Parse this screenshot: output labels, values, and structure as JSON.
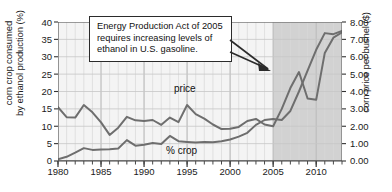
{
  "chart_data": {
    "type": "line",
    "title": "",
    "xlabel": "",
    "ylabel": "corn crop consumed by ethanol production (%)",
    "ylabel_right": "corn price per bushel ($)",
    "xlim": [
      1980,
      2013
    ],
    "ylim": [
      0,
      40
    ],
    "ylim_right": [
      0.0,
      8.0
    ],
    "yticks": [
      0,
      5,
      10,
      15,
      20,
      25,
      30,
      35,
      40
    ],
    "ytick_labels": [
      "0",
      "5",
      "10",
      "15",
      "20",
      "25",
      "30",
      "35",
      "40"
    ],
    "yticks_right": [
      0.0,
      1.0,
      2.0,
      3.0,
      4.0,
      5.0,
      6.0,
      7.0,
      8.0
    ],
    "ytick_labels_right": [
      "0.00",
      "1.00",
      "2.00",
      "3.00",
      "4.00",
      "5.00",
      "6.00",
      "7.00",
      "8.00"
    ],
    "xticks": [
      1980,
      1985,
      1990,
      1995,
      2000,
      2005,
      2010
    ],
    "xtick_labels": [
      "1980",
      "1985",
      "1990",
      "1995",
      "2000",
      "2005",
      "2010"
    ],
    "minor_x_interval": 1,
    "grid": true,
    "legend_position": "inline-annotations",
    "x": [
      1980,
      1981,
      1982,
      1983,
      1984,
      1985,
      1986,
      1987,
      1988,
      1989,
      1990,
      1991,
      1992,
      1993,
      1994,
      1995,
      1996,
      1997,
      1998,
      1999,
      2000,
      2001,
      2002,
      2003,
      2004,
      2005,
      2006,
      2007,
      2008,
      2009,
      2010,
      2011,
      2012,
      2013
    ],
    "series": [
      {
        "name": "price",
        "label": "price",
        "axis": "right",
        "unit": "$ per bushel",
        "color": "#6e6e6e",
        "values": [
          3.1,
          2.52,
          2.5,
          3.22,
          2.8,
          2.22,
          1.5,
          1.92,
          2.54,
          2.34,
          2.3,
          2.36,
          2.08,
          2.5,
          2.24,
          3.22,
          2.7,
          2.44,
          2.1,
          1.84,
          1.86,
          1.96,
          2.3,
          2.42,
          2.1,
          2.0,
          3.0,
          4.2,
          5.12,
          3.6,
          3.52,
          6.22,
          7.1,
          7.4
        ]
      },
      {
        "name": "percent-crop",
        "label": "% crop",
        "axis": "left",
        "unit": "% of corn crop",
        "color": "#6e6e6e",
        "values": [
          0.5,
          1.2,
          2.4,
          3.7,
          3.2,
          3.3,
          3.4,
          3.6,
          6.0,
          4.4,
          4.7,
          5.2,
          4.9,
          7.2,
          5.7,
          5.5,
          5.3,
          5.5,
          5.4,
          5.7,
          6.2,
          7.0,
          8.1,
          10.4,
          11.8,
          12.1,
          11.8,
          14.4,
          20.0,
          26.0,
          32.0,
          36.8,
          36.5,
          37.4
        ]
      }
    ],
    "shaded_region": {
      "name": "post-2005-policy-period",
      "from": 2005,
      "to": 2013,
      "color": "#d2d2d2"
    },
    "annotations": [
      {
        "name": "energy-production-act-callout",
        "lines": [
          "Energy Production Act of 2005",
          "requires increasing levels of",
          "ethanol in U.S. gasoline."
        ],
        "points_to_year": 2005
      }
    ]
  }
}
